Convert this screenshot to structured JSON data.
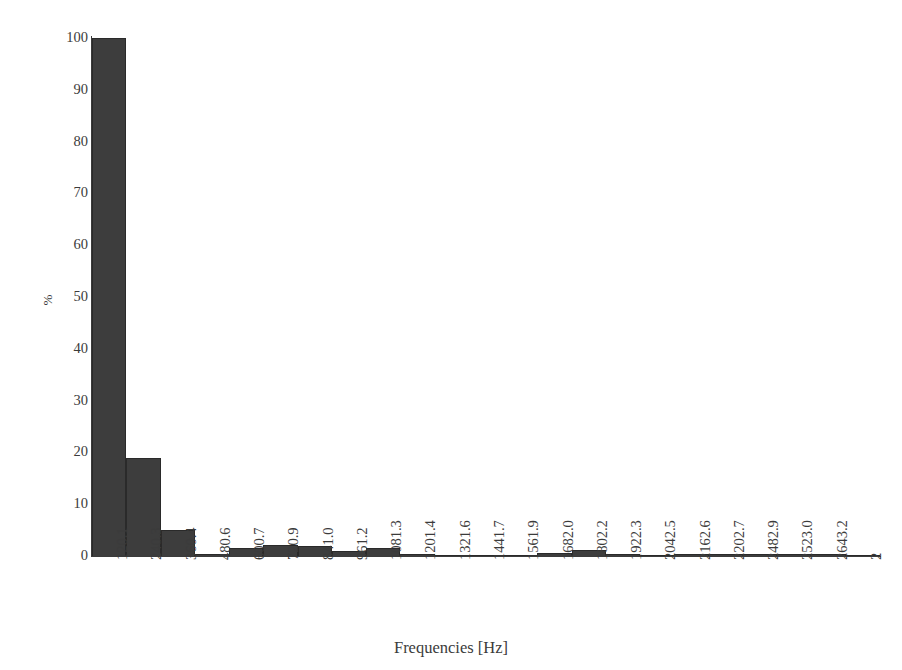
{
  "chart_data": {
    "type": "bar",
    "title": "",
    "subtitle": "",
    "xlabel": "Frequencies [Hz]",
    "ylabel": "%",
    "ylim": [
      0,
      100
    ],
    "yticks": [
      0,
      10,
      20,
      30,
      40,
      50,
      60,
      70,
      80,
      90,
      100
    ],
    "grid": false,
    "legend": null,
    "legend_position": "none",
    "bar_color": "#3d3d3d",
    "axis_color": "#3b3b3b",
    "categories": [
      "120.1",
      "240.3",
      "360.4",
      "480.6",
      "600.7",
      "720.9",
      "841.0",
      "961.2",
      "1081.3",
      "1201.4",
      "1321.6",
      "1441.7",
      "1561.9",
      "1682.0",
      "1802.2",
      "1922.3",
      "2042.5",
      "2162.6",
      "2202.7",
      "2482.9",
      "2523.0",
      "2643.2",
      "2"
    ],
    "values": [
      100.0,
      18.9,
      5.0,
      0.4,
      1.6,
      2.1,
      1.9,
      1.0,
      1.6,
      0.3,
      0.2,
      0.15,
      0.2,
      0.5,
      1.1,
      0.3,
      0.2,
      0.3,
      0.3,
      0.3,
      0.4,
      0.3,
      0.2
    ]
  },
  "axes": {
    "y_title": "%",
    "x_title": "Frequencies [Hz]"
  }
}
